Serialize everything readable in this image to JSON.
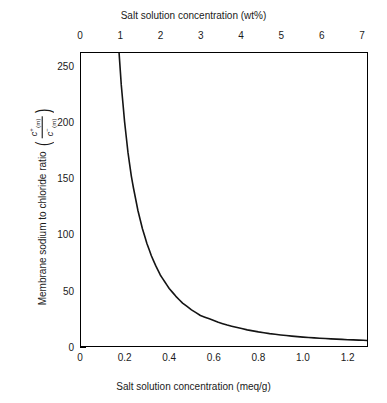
{
  "chart_data": {
    "type": "line",
    "title": "",
    "xlabel": "Salt solution concentration (meq/g)",
    "xlabel_top": "Salt solution concentration (wt%)",
    "ylabel": "Membrane sodium to chloride ratio",
    "ylabel_numerator": "c+(m)",
    "ylabel_denominator": "c-(m)",
    "xlim": [
      0,
      1.2915
    ],
    "ylim": [
      0,
      262
    ],
    "ylim_top_label": 250,
    "xlim_top": [
      0,
      7.15
    ],
    "grid": false,
    "legend": null,
    "line_color": "#141414",
    "x_ticks": [
      0,
      0.2,
      0.4,
      0.6,
      0.8,
      1.0,
      1.2
    ],
    "x_tick_labels": [
      "0",
      "0.2",
      "0.4",
      "0.6",
      "0.8",
      "1.0",
      "1.2"
    ],
    "x_ticks_top": [
      0,
      1,
      2,
      3,
      4,
      5,
      6,
      7
    ],
    "x_tick_labels_top": [
      "0",
      "1",
      "2",
      "3",
      "4",
      "5",
      "6",
      "7"
    ],
    "y_ticks": [
      0,
      50,
      100,
      150,
      200,
      250
    ],
    "y_tick_labels": [
      "0",
      "50",
      "100",
      "150",
      "200",
      "250"
    ],
    "x": [
      0.175,
      0.185,
      0.2,
      0.215,
      0.23,
      0.24,
      0.26,
      0.28,
      0.3,
      0.32,
      0.34,
      0.36,
      0.38,
      0.4,
      0.43,
      0.46,
      0.5,
      0.54,
      0.58,
      0.62,
      0.66,
      0.7,
      0.75,
      0.8,
      0.85,
      0.9,
      0.95,
      1.0,
      1.05,
      1.1,
      1.15,
      1.2,
      1.25,
      1.2915
    ],
    "values": [
      262,
      233,
      200,
      173,
      152,
      141,
      121,
      105,
      92,
      81,
      72,
      64,
      58,
      52,
      45,
      39,
      33,
      28,
      25,
      22,
      19.5,
      17.5,
      15.2,
      13.4,
      11.9,
      10.7,
      9.7,
      8.8,
      8.1,
      7.5,
      7.0,
      6.5,
      6.1,
      5.8
    ],
    "annotations": []
  }
}
